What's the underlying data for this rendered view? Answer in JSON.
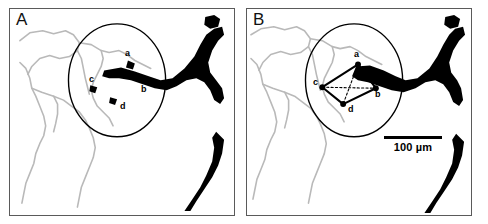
{
  "figure": {
    "type": "two-panel microvascular network micrograph",
    "background_color": "#ffffff",
    "frame_color": "#5a5a5a",
    "capillary_color": "#b9b9b9",
    "vessel_color": "#000000",
    "roi_circle_color": "#000000"
  },
  "panels": [
    {
      "letter": "A",
      "roi": {
        "shape": "ellipse",
        "cx": 108,
        "cy": 72,
        "rx": 49,
        "ry": 57
      },
      "nodes": [
        {
          "id": "a",
          "label": "a",
          "x": 120,
          "y": 55,
          "label_x": 115,
          "label_y": 40
        },
        {
          "id": "b",
          "label": "b",
          "x": 134,
          "y": 80,
          "label_x": 131,
          "label_y": 76
        },
        {
          "id": "c",
          "label": "c",
          "x": 84,
          "y": 80,
          "label_x": 79,
          "label_y": 66
        },
        {
          "id": "d",
          "label": "d",
          "x": 104,
          "y": 93,
          "label_x": 110,
          "label_y": 93
        }
      ],
      "connections": []
    },
    {
      "letter": "B",
      "roi": {
        "shape": "ellipse",
        "cx": 108,
        "cy": 72,
        "rx": 49,
        "ry": 57
      },
      "nodes": [
        {
          "id": "a",
          "label": "a",
          "x": 112,
          "y": 56,
          "label_x": 107,
          "label_y": 41
        },
        {
          "id": "b",
          "label": "b",
          "x": 130,
          "y": 80,
          "label_x": 128,
          "label_y": 81
        },
        {
          "id": "c",
          "label": "c",
          "x": 76,
          "y": 79,
          "label_x": 66,
          "label_y": 69
        },
        {
          "id": "d",
          "label": "d",
          "x": 97,
          "y": 96,
          "label_x": 101,
          "label_y": 96
        }
      ],
      "connections": [
        {
          "from": "a",
          "to": "c",
          "style": "solid"
        },
        {
          "from": "c",
          "to": "d",
          "style": "solid"
        },
        {
          "from": "a",
          "to": "b",
          "style": "solid"
        },
        {
          "from": "b",
          "to": "d",
          "style": "solid"
        },
        {
          "from": "a",
          "to": "d",
          "style": "dashed"
        },
        {
          "from": "c",
          "to": "b",
          "style": "dashed"
        }
      ],
      "scalebar": {
        "label": "100 µm",
        "bar_length_px": 58
      }
    }
  ]
}
